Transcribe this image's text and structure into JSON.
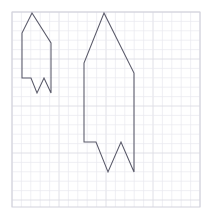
{
  "canvas": {
    "width": 212,
    "height": 223,
    "background_color": "#ffffff",
    "title": "Two scaled rocket polygons on graph paper"
  },
  "grid": {
    "name": "graph-paper-grid",
    "x_start": 12,
    "y_start": 12,
    "x_end": 200,
    "y_end": 207,
    "cell_size": 9.4,
    "major_every": 5,
    "minor_color": "#e9e9ef",
    "major_color": "#dcdce4",
    "border_color": "#d2d2dc",
    "columns": 20,
    "rows": 21
  },
  "chart_data": {
    "type": "scatter",
    "xlabel": "",
    "ylabel": "",
    "grid": true,
    "legend": "none",
    "xlim": [
      12,
      200
    ],
    "ylim": [
      12,
      207
    ],
    "series": [
      {
        "name": "small-rocket",
        "closed": true,
        "stroke": "#585868",
        "points": [
          [
            32,
            13
          ],
          [
            51,
            43
          ],
          [
            51,
            93
          ],
          [
            44,
            78
          ],
          [
            37,
            93
          ],
          [
            31,
            78
          ],
          [
            22,
            78
          ],
          [
            22,
            33
          ]
        ]
      },
      {
        "name": "large-rocket",
        "closed": true,
        "stroke": "#585868",
        "points": [
          [
            104,
            13
          ],
          [
            134,
            73
          ],
          [
            134,
            172
          ],
          [
            121,
            142
          ],
          [
            108,
            172
          ],
          [
            96,
            142
          ],
          [
            84,
            142
          ],
          [
            84,
            63
          ]
        ]
      }
    ]
  },
  "shapes": {
    "small_rocket": {
      "name": "small-rocket-polygon",
      "path": "M 32 13 L 51 43 L 51 93 L 44 78 L 37 93 L 31 78 L 22 78 L 22 33 Z",
      "stroke_color": "#585868",
      "stroke_width": 1.05
    },
    "large_rocket": {
      "name": "large-rocket-polygon",
      "path": "M 104 13 L 134 73 L 134 172 L 121 142 L 108 172 L 96 142 L 84 142 L 84 63 Z",
      "stroke_color": "#585868",
      "stroke_width": 1.05
    }
  }
}
